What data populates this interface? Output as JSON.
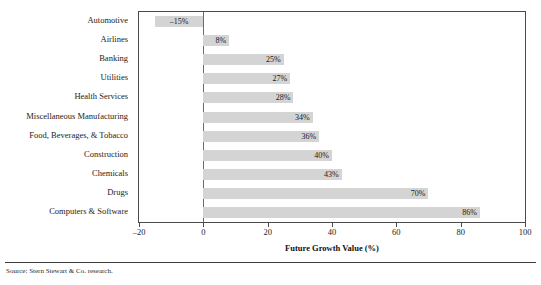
{
  "chart_data": {
    "type": "bar",
    "orientation": "horizontal",
    "title": "",
    "xlabel": "Future Growth Value (%)",
    "ylabel": "",
    "xlim": [
      -20,
      100
    ],
    "xticks": [
      -20,
      0,
      20,
      40,
      60,
      80,
      100
    ],
    "xtick_labels": [
      "–20",
      "0",
      "20",
      "40",
      "60",
      "80",
      "100"
    ],
    "grid": false,
    "legend": null,
    "bar_color": "#d4d4d4",
    "categories": [
      "Automotive",
      "Airlines",
      "Banking",
      "Utilities",
      "Health Services",
      "Miscellaneous Manufacturing",
      "Food, Beverages, & Tobacco",
      "Construction",
      "Chemicals",
      "Drugs",
      "Computers & Software"
    ],
    "values": [
      -15,
      8,
      25,
      27,
      28,
      34,
      36,
      40,
      43,
      70,
      86
    ],
    "data_labels": [
      "–15%",
      "8%",
      "25%",
      "27%",
      "28%",
      "34%",
      "36%",
      "40%",
      "43%",
      "70%",
      "86%"
    ]
  },
  "footer": {
    "source": "Source: Stern Stewart & Co. research."
  }
}
